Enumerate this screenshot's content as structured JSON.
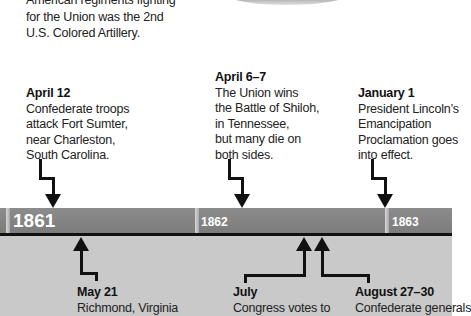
{
  "caption": {
    "lines": [
      "American regiments fighting",
      "for the Union was the 2nd",
      "U.S. Colored Artillery."
    ]
  },
  "timeline": {
    "years": [
      {
        "label": "1861"
      },
      {
        "label": "1862"
      },
      {
        "label": "1863"
      }
    ],
    "colors": {
      "bar": "#858585",
      "divider": "#c8c8c8",
      "lower_band": "#c9c9c9",
      "line": "#111111"
    }
  },
  "events_above": [
    {
      "date": "April 12",
      "lines": [
        "Confederate troops",
        "attack Fort Sumter,",
        "near Charleston,",
        "South Carolina."
      ]
    },
    {
      "date": "April  6–7",
      "lines": [
        "The Union wins",
        "the Battle of Shiloh,",
        "in Tennessee,",
        "but many die on",
        "both sides."
      ]
    },
    {
      "date": "January 1",
      "lines": [
        "President Lincoln’s",
        "Emancipation",
        "Proclamation goes",
        "into effect."
      ]
    }
  ],
  "events_below": [
    {
      "date": "May 21",
      "lines": [
        "Richmond, Virginia"
      ]
    },
    {
      "date": "July",
      "lines": [
        "Congress votes to"
      ]
    },
    {
      "date": "August 27–30",
      "lines": [
        "Confederate generals"
      ]
    }
  ]
}
